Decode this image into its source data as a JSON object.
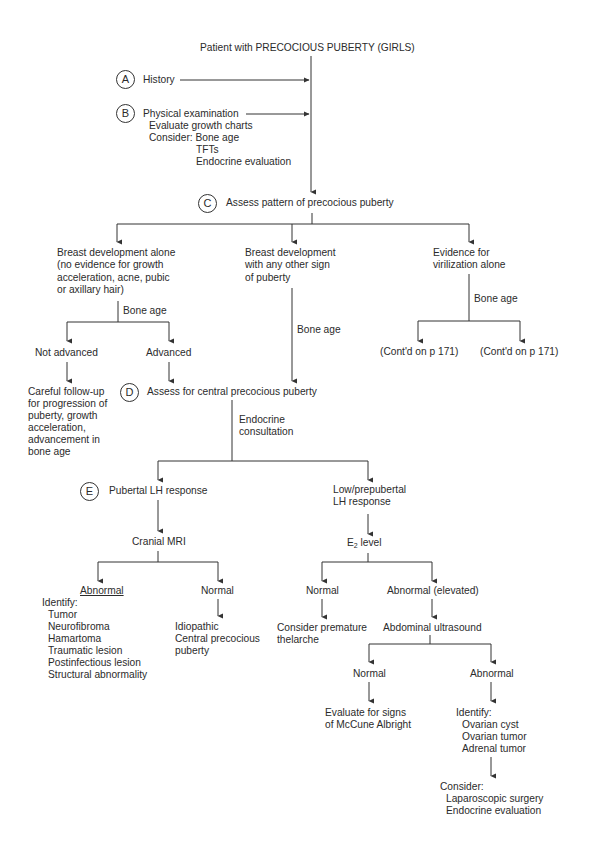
{
  "title": "Patient with PRECOCIOUS PUBERTY (GIRLS)",
  "steps": {
    "A": {
      "letter": "A",
      "label": "History"
    },
    "B": {
      "letter": "B",
      "label": "Physical examination",
      "details": [
        "Evaluate growth charts",
        "Consider: Bone age",
        "TFTs",
        "Endocrine evaluation"
      ]
    },
    "C": {
      "letter": "C",
      "label": "Assess pattern of precocious puberty"
    },
    "D": {
      "letter": "D",
      "label": "Assess for central precocious puberty"
    },
    "E": {
      "letter": "E",
      "label": "Pubertal LH response"
    }
  },
  "branches": {
    "breast_alone": [
      "Breast development alone",
      "(no evidence for growth",
      "acceleration, acne, pubic",
      "or axillary hair)"
    ],
    "breast_other": [
      "Breast development",
      "with any other sign",
      "of puberty"
    ],
    "virilization": [
      "Evidence for",
      "virilization alone"
    ]
  },
  "edge_labels": {
    "bone_age_left": "Bone age",
    "bone_age_mid": "Bone age",
    "bone_age_right": "Bone age",
    "endocrine_consult": [
      "Endocrine",
      "consultation"
    ]
  },
  "nodes": {
    "not_advanced": "Not advanced",
    "advanced": "Advanced",
    "careful_followup": [
      "Careful follow-up",
      "for progression of",
      "puberty, growth",
      "acceleration,",
      "advancement in",
      "bone age"
    ],
    "contd_1": "(Cont'd on p 171)",
    "contd_2": "(Cont'd on p 171)",
    "low_lh": [
      "Low/prepubertal",
      "LH response"
    ],
    "cranial_mri": "Cranial MRI",
    "e2_base": "E",
    "e2_sub": "2",
    "e2_rest": " level",
    "mri_abnormal": "Abnormal",
    "mri_abnormal_list": [
      "Identify:",
      "Tumor",
      "Neurofibroma",
      "Hamartoma",
      "Traumatic lesion",
      "Postinfectious lesion",
      "Structural abnormality"
    ],
    "mri_normal": "Normal",
    "idiopathic": [
      "Idiopathic",
      "Central precocious",
      "puberty"
    ],
    "e2_normal": "Normal",
    "e2_abnormal": "Abnormal (elevated)",
    "premature_thelarche": [
      "Consider premature",
      "thelarche"
    ],
    "abd_us": "Abdominal ultrasound",
    "us_normal": "Normal",
    "us_abnormal": "Abnormal",
    "mccune": [
      "Evaluate for signs",
      "of McCune Albright"
    ],
    "us_abnormal_list": [
      "Identify:",
      "Ovarian cyst",
      "Ovarian tumor",
      "Adrenal tumor"
    ],
    "consider_list": [
      "Consider:",
      "Laparoscopic surgery",
      "Endocrine evaluation"
    ]
  }
}
